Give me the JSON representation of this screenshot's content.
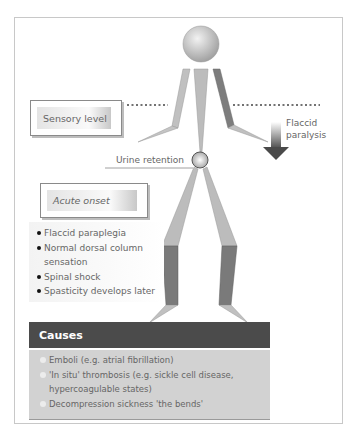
{
  "diagram": {
    "labels": {
      "sensory_level": "Sensory level",
      "flaccid_paralysis_line1": "Flaccid",
      "flaccid_paralysis_line2": "paralysis",
      "urine_retention": "Urine retention",
      "acute_onset": "Acute onset"
    },
    "acute_onset_features": [
      "Flaccid paraplegia",
      "Normal dorsal column sensation",
      "Spinal shock",
      "Spasticity develops later"
    ],
    "causes": {
      "title": "Causes",
      "items": [
        "Emboli (e.g. atrial fibrillation)",
        "'In situ' thrombosis (e.g. sickle cell disease, hypercoagulable states)",
        "Decompression sickness 'the bends'"
      ]
    },
    "colors": {
      "limb_light": "#b9b9b9",
      "limb_dark": "#7a7a7a",
      "causes_header": "#4b4b4b",
      "causes_body": "#d2d2d2"
    }
  }
}
